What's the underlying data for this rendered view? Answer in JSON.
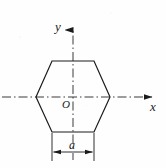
{
  "figure": {
    "labels": {
      "y_axis": "y",
      "x_axis": "x",
      "origin": "O",
      "dimension": "a"
    },
    "colors": {
      "outline": "#1a1a1a",
      "centerline": "#555555",
      "background": "#fefefe"
    },
    "geometry": {
      "shape": "hexagon",
      "orientation": "flat-top",
      "vertices": [
        [
          52,
          61
        ],
        [
          94,
          61
        ],
        [
          110,
          97
        ],
        [
          94,
          132
        ],
        [
          52,
          132
        ],
        [
          36,
          97
        ]
      ],
      "origin_point": [
        73,
        97
      ],
      "x_axis": {
        "y": 97,
        "x_start": 2,
        "x_end": 160,
        "arrow": "right"
      },
      "y_axis": {
        "x": 73,
        "y_start": 160,
        "y_end": 22,
        "arrow": "up"
      },
      "dimension_line": {
        "y": 152,
        "x_start": 52,
        "x_end": 94,
        "arrows": "both-outward"
      },
      "extension_lines": [
        {
          "x": 52,
          "y_start": 132,
          "y_end": 160
        },
        {
          "x": 94,
          "y_start": 132,
          "y_end": 160
        }
      ]
    }
  }
}
